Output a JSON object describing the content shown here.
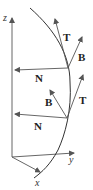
{
  "diagram": {
    "axes": {
      "x_label": "x",
      "y_label": "y",
      "z_label": "z"
    },
    "frame_upper": {
      "tangent_label": "T",
      "binormal_label": "B",
      "normal_label": "N"
    },
    "frame_lower": {
      "tangent_label": "T",
      "binormal_label": "B",
      "normal_label": "N"
    },
    "colors": {
      "line": "#555555",
      "curve": "#333333",
      "text": "#222222",
      "background": "#ffffff"
    }
  }
}
